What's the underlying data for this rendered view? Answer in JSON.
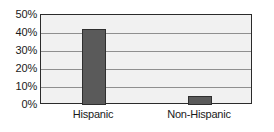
{
  "chart_data": {
    "type": "bar",
    "title": "",
    "subtitle": "",
    "xlabel": "",
    "ylabel": "",
    "categories": [
      "Hispanic",
      "Non-Hispanic"
    ],
    "values": [
      42.5,
      5
    ],
    "ylim": [
      0,
      50
    ],
    "ytick_values": [
      50,
      40,
      30,
      20,
      10,
      0
    ],
    "ytick_labels": [
      "50%",
      "40%",
      "30%",
      "20%",
      "10%",
      "0%"
    ],
    "grid": true,
    "grid_orientation": "horizontal",
    "legend": false,
    "legend_position": "none",
    "value_format": "percent",
    "annotations": []
  },
  "style": {
    "bar_fill": "#5a5a5a",
    "bar_border": "#2f2f2f",
    "plot_background": "#f1f1f1",
    "plot_border": "#2b2b2b",
    "gridline_color": "#8f8f8f",
    "text_color": "#1a1a1a",
    "page_background": "#ffffff"
  }
}
